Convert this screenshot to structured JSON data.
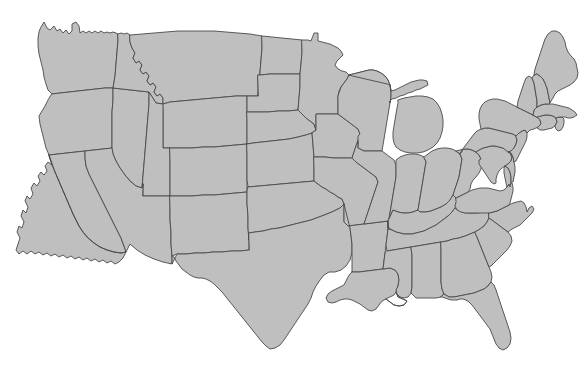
{
  "figure": {
    "type": "map",
    "width_px": 585,
    "height_px": 374,
    "background_color": "#ffffff",
    "land_fill_color": "#bfbfbf",
    "border_stroke_color": "#4a4a4a",
    "border_stroke_width_px": 0.9,
    "projection_hint": "albers-usa-like",
    "water_rendered_as_background": true,
    "labels_present": false,
    "legend_present": false,
    "region_coverage": "lower-48-states"
  },
  "map": {
    "name": "united-states-outline-map",
    "region_count": 49,
    "regions": [
      {
        "code": "WA",
        "name": "Washington"
      },
      {
        "code": "OR",
        "name": "Oregon"
      },
      {
        "code": "CA",
        "name": "California"
      },
      {
        "code": "NV",
        "name": "Nevada"
      },
      {
        "code": "ID",
        "name": "Idaho"
      },
      {
        "code": "MT",
        "name": "Montana"
      },
      {
        "code": "WY",
        "name": "Wyoming"
      },
      {
        "code": "UT",
        "name": "Utah"
      },
      {
        "code": "AZ",
        "name": "Arizona"
      },
      {
        "code": "NM",
        "name": "New Mexico"
      },
      {
        "code": "CO",
        "name": "Colorado"
      },
      {
        "code": "ND",
        "name": "North Dakota"
      },
      {
        "code": "SD",
        "name": "South Dakota"
      },
      {
        "code": "NE",
        "name": "Nebraska"
      },
      {
        "code": "KS",
        "name": "Kansas"
      },
      {
        "code": "OK",
        "name": "Oklahoma"
      },
      {
        "code": "TX",
        "name": "Texas"
      },
      {
        "code": "MN",
        "name": "Minnesota"
      },
      {
        "code": "IA",
        "name": "Iowa"
      },
      {
        "code": "MO",
        "name": "Missouri"
      },
      {
        "code": "AR",
        "name": "Arkansas"
      },
      {
        "code": "LA",
        "name": "Louisiana"
      },
      {
        "code": "WI",
        "name": "Wisconsin"
      },
      {
        "code": "IL",
        "name": "Illinois"
      },
      {
        "code": "MI",
        "name": "Michigan"
      },
      {
        "code": "IN",
        "name": "Indiana"
      },
      {
        "code": "OH",
        "name": "Ohio"
      },
      {
        "code": "KY",
        "name": "Kentucky"
      },
      {
        "code": "TN",
        "name": "Tennessee"
      },
      {
        "code": "MS",
        "name": "Mississippi"
      },
      {
        "code": "AL",
        "name": "Alabama"
      },
      {
        "code": "GA",
        "name": "Georgia"
      },
      {
        "code": "FL",
        "name": "Florida"
      },
      {
        "code": "SC",
        "name": "South Carolina"
      },
      {
        "code": "NC",
        "name": "North Carolina"
      },
      {
        "code": "VA",
        "name": "Virginia"
      },
      {
        "code": "WV",
        "name": "West Virginia"
      },
      {
        "code": "MD",
        "name": "Maryland"
      },
      {
        "code": "DE",
        "name": "Delaware"
      },
      {
        "code": "PA",
        "name": "Pennsylvania"
      },
      {
        "code": "NJ",
        "name": "New Jersey"
      },
      {
        "code": "NY",
        "name": "New York"
      },
      {
        "code": "CT",
        "name": "Connecticut"
      },
      {
        "code": "RI",
        "name": "Rhode Island"
      },
      {
        "code": "MA",
        "name": "Massachusetts"
      },
      {
        "code": "VT",
        "name": "Vermont"
      },
      {
        "code": "NH",
        "name": "New Hampshire"
      },
      {
        "code": "ME",
        "name": "Maine"
      },
      {
        "code": "DC",
        "name": "District of Columbia"
      }
    ],
    "water_features": [
      {
        "name": "Lake Superior"
      },
      {
        "name": "Lake Michigan"
      },
      {
        "name": "Lake Huron"
      },
      {
        "name": "Lake Erie"
      },
      {
        "name": "Lake Ontario"
      },
      {
        "name": "Chesapeake Bay"
      },
      {
        "name": "Gulf of Mexico"
      },
      {
        "name": "Atlantic Ocean"
      },
      {
        "name": "Pacific Ocean"
      }
    ]
  }
}
